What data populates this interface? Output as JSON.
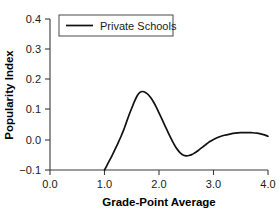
{
  "chart_data": {
    "type": "line",
    "title": "",
    "xlabel": "Grade-Point Average",
    "ylabel": "Popularity Index",
    "xlim": [
      0.0,
      4.0
    ],
    "ylim": [
      -0.1,
      0.4
    ],
    "grid": false,
    "legend_position": "top-left-inside",
    "x_ticks": [
      "0.0",
      "1.0",
      "2.0",
      "3.0",
      "4.0"
    ],
    "x_tick_values": [
      0.0,
      1.0,
      2.0,
      3.0,
      4.0
    ],
    "y_ticks": [
      "−0.1",
      "0.0",
      "0.1",
      "0.2",
      "0.3",
      "0.4"
    ],
    "y_tick_values": [
      -0.1,
      0.0,
      0.1,
      0.2,
      0.3,
      0.4
    ],
    "series": [
      {
        "name": "Private Schools",
        "color": "#111111",
        "x": [
          1.0,
          1.05,
          1.1,
          1.15,
          1.2,
          1.25,
          1.3,
          1.35,
          1.4,
          1.45,
          1.5,
          1.55,
          1.6,
          1.65,
          1.7,
          1.75,
          1.8,
          1.85,
          1.9,
          1.95,
          2.0,
          2.05,
          2.1,
          2.15,
          2.2,
          2.25,
          2.3,
          2.35,
          2.4,
          2.45,
          2.5,
          2.55,
          2.6,
          2.65,
          2.7,
          2.75,
          2.8,
          2.85,
          2.9,
          2.95,
          3.0,
          3.1,
          3.2,
          3.3,
          3.4,
          3.5,
          3.6,
          3.7,
          3.8,
          3.9,
          4.0
        ],
        "y": [
          -0.1,
          -0.083,
          -0.066,
          -0.048,
          -0.029,
          -0.01,
          0.01,
          0.032,
          0.057,
          0.082,
          0.105,
          0.127,
          0.146,
          0.157,
          0.16,
          0.157,
          0.15,
          0.139,
          0.125,
          0.108,
          0.089,
          0.07,
          0.05,
          0.031,
          0.012,
          -0.006,
          -0.022,
          -0.035,
          -0.045,
          -0.051,
          -0.053,
          -0.052,
          -0.049,
          -0.044,
          -0.038,
          -0.031,
          -0.024,
          -0.017,
          -0.01,
          -0.004,
          0.001,
          0.009,
          0.015,
          0.019,
          0.022,
          0.0235,
          0.024,
          0.0235,
          0.022,
          0.018,
          0.012
        ]
      }
    ]
  },
  "legend": {
    "entries": [
      {
        "label": "Private Schools"
      }
    ]
  },
  "axes": {
    "x_title": "Grade-Point Average",
    "y_title": "Popularity Index"
  }
}
